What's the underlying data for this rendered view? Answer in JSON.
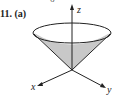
{
  "figure": {
    "number_label": "11.",
    "part_label": "(a)",
    "top_fragment": "6",
    "axes": {
      "x": "x",
      "y": "y",
      "z": "z"
    },
    "shade_color": "#c8c8c8",
    "line_color": "#222222"
  }
}
